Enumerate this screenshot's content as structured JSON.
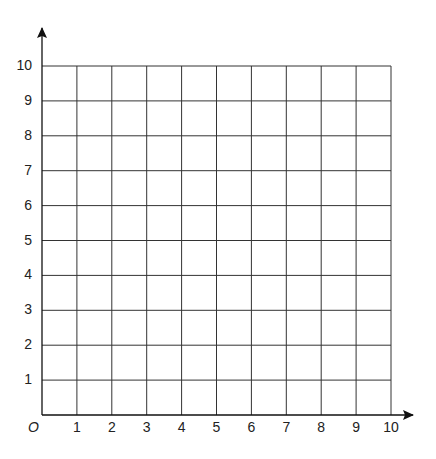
{
  "chart_data": {
    "type": "scatter",
    "title": "",
    "xlabel": "",
    "ylabel": "",
    "xlim": [
      0,
      10
    ],
    "ylim": [
      0,
      10
    ],
    "grid": true,
    "origin_label": "O",
    "x_ticks": [
      "1",
      "2",
      "3",
      "4",
      "5",
      "6",
      "7",
      "8",
      "9",
      "10"
    ],
    "y_ticks": [
      "1",
      "2",
      "3",
      "4",
      "5",
      "6",
      "7",
      "8",
      "9",
      "10"
    ],
    "series": [],
    "legend": null
  },
  "style": {
    "grid_color": "#333333",
    "axis_color": "#111111"
  }
}
